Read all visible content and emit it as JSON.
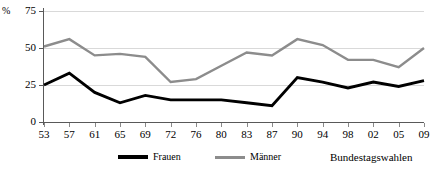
{
  "chart_data": {
    "type": "line",
    "title": "",
    "xlabel": "Bundestagswahlen",
    "ylabel": "%",
    "ylim": [
      0,
      75
    ],
    "yticks": [
      0,
      25,
      50,
      75
    ],
    "grid": true,
    "legend_position": "bottom",
    "categories": [
      "53",
      "57",
      "61",
      "65",
      "69",
      "72",
      "76",
      "80",
      "83",
      "87",
      "90",
      "94",
      "98",
      "02",
      "05",
      "09"
    ],
    "series": [
      {
        "name": "Frauen",
        "color": "#000000",
        "values": [
          25,
          33,
          20,
          13,
          18,
          15,
          15,
          15,
          13,
          11,
          30,
          27,
          23,
          27,
          24,
          28
        ]
      },
      {
        "name": "Männer",
        "color": "#8c8c8c",
        "values": [
          51,
          56,
          45,
          46,
          44,
          27,
          29,
          38,
          47,
          45,
          56,
          52,
          42,
          42,
          37,
          50
        ]
      }
    ]
  },
  "axis": {
    "y_unit_label": "%",
    "y_tick_labels": [
      "75",
      "50",
      "25",
      "0"
    ],
    "x_tick_labels": [
      "53",
      "57",
      "61",
      "65",
      "69",
      "72",
      "76",
      "80",
      "83",
      "87",
      "90",
      "94",
      "98",
      "02",
      "05",
      "09"
    ],
    "x_axis_caption": "Bundestagswahlen"
  },
  "legend": {
    "items": [
      {
        "label": "Frauen",
        "color": "#000000"
      },
      {
        "label": "Männer",
        "color": "#8c8c8c"
      }
    ]
  }
}
